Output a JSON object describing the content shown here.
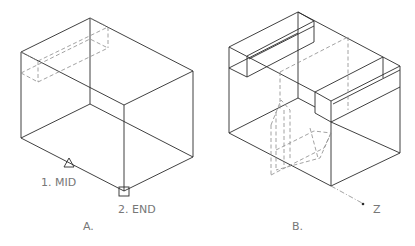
{
  "figure_a": {
    "caption": "A.",
    "snap_labels": [
      {
        "text": "1.  MID",
        "marker": "triangle"
      },
      {
        "text": "2.  END",
        "marker": "square"
      }
    ]
  },
  "figure_b": {
    "caption": "B.",
    "axis_label": "Z"
  },
  "colors": {
    "line": "#2b2b2b",
    "hidden_line": "#8a8a8a",
    "text": "#777777",
    "background": "#ffffff"
  }
}
